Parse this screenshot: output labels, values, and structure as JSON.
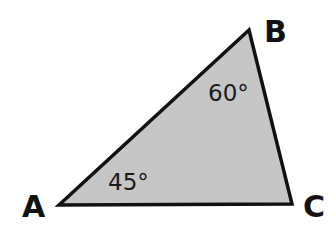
{
  "diagram": {
    "type": "triangle",
    "fill_color": "#c6c6c6",
    "stroke_color": "#111111",
    "vertices": [
      {
        "name": "A",
        "label": "A",
        "x": 59,
        "y": 205
      },
      {
        "name": "B",
        "label": "B",
        "x": 249,
        "y": 30
      },
      {
        "name": "C",
        "label": "C",
        "x": 292,
        "y": 204
      }
    ],
    "angles": [
      {
        "vertex": "A",
        "label": "45°"
      },
      {
        "vertex": "B",
        "label": "60°"
      }
    ]
  }
}
